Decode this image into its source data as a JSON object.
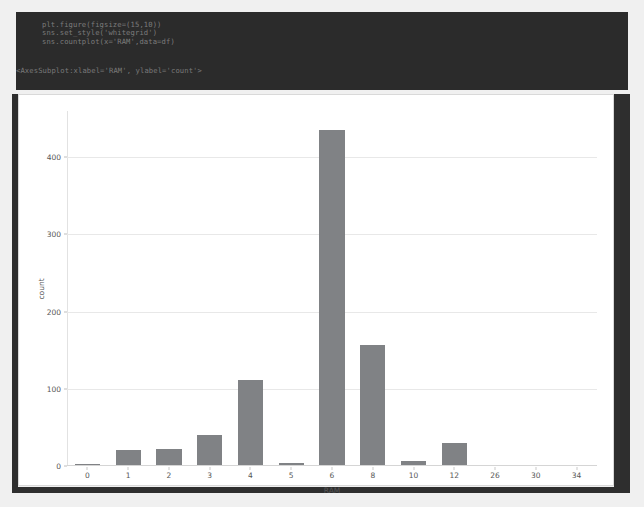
{
  "notebook": {
    "code_lines": [
      "plt.figure(figsize=(15,10))",
      "sns.set_style('whitegrid')",
      "sns.countplot(x='RAM',data=df)"
    ],
    "output_repr": "<AxesSubplot:xlabel='RAM', ylabel='count'>"
  },
  "colors": {
    "bar": "#808285",
    "code_cell_bg": "#2b2b2b",
    "page_bg": "#f0f0f0",
    "grid": "#e8e8e8",
    "frame": "#2e2e2e"
  },
  "chart_data": {
    "type": "bar",
    "title": "",
    "xlabel": "RAM",
    "ylabel": "count",
    "categories": [
      "0",
      "1",
      "2",
      "3",
      "4",
      "5",
      "6",
      "8",
      "10",
      "12",
      "26",
      "30",
      "34"
    ],
    "values": [
      2,
      21,
      22,
      40,
      112,
      4,
      435,
      157,
      7,
      30,
      0,
      0,
      0
    ],
    "ylim": [
      0,
      460
    ],
    "yticks": [
      0,
      100,
      200,
      300,
      400
    ],
    "ytick_labels": [
      "0",
      "100",
      "200",
      "300",
      "400"
    ],
    "grid": true,
    "legend": "none"
  }
}
